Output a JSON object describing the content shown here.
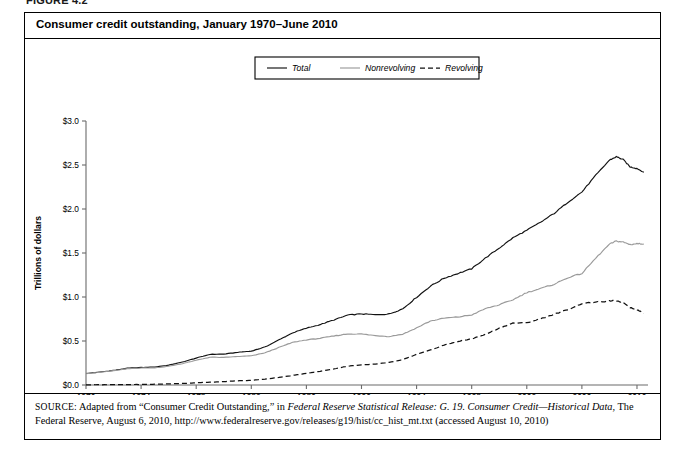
{
  "figure": {
    "label": "FIGURE 4.2",
    "title": "Consumer credit outstanding, January 1970–June 2010"
  },
  "source": {
    "prefix": "SOURCE:",
    "part1": " Adapted from “Consumer Credit Outstanding,” in ",
    "italic1": "Federal Reserve Statistical Release: G. 19. Consumer Credit—Historical Data",
    "part2": ", The Federal Reserve, August 6, 2010, http://www.federalreserve.gov/releases/g19/hist/cc_hist_mt.txt (accessed August 10, 2010)"
  },
  "chart_data": {
    "type": "line",
    "title": "Consumer credit outstanding, January 1970–June 2010",
    "xlabel": "Date",
    "ylabel": "Trillions of dollars",
    "xlim": [
      1970,
      2010.8
    ],
    "ylim": [
      0.0,
      3.0
    ],
    "grid": false,
    "legend_position": "top-center",
    "xticks": [
      1970,
      1974,
      1978,
      1982,
      1986,
      1990,
      1994,
      1998,
      2002,
      2006,
      2010
    ],
    "xtick_labels": [
      "1970",
      "1974",
      "1978",
      "1982",
      "1986",
      "1990",
      "1994",
      "1998",
      "2002",
      "2006",
      "2010"
    ],
    "yticks": [
      0.0,
      0.5,
      1.0,
      1.5,
      2.0,
      2.5,
      3.0
    ],
    "ytick_labels": [
      "$0.0",
      "$0.5",
      "$1.0",
      "$1.5",
      "$2.0",
      "$2.5",
      "$3.0"
    ],
    "x": [
      1970,
      1971,
      1972,
      1973,
      1974,
      1975,
      1976,
      1977,
      1978,
      1979,
      1980,
      1981,
      1982,
      1983,
      1984,
      1985,
      1986,
      1987,
      1988,
      1989,
      1990,
      1991,
      1992,
      1993,
      1994,
      1995,
      1996,
      1997,
      1998,
      1999,
      2000,
      2001,
      2002,
      2003,
      2004,
      2005,
      2006,
      2007,
      2008,
      2008.5,
      2009,
      2009.5,
      2010,
      2010.5
    ],
    "series": [
      {
        "name": "Total",
        "style": "solid",
        "color": "#111111",
        "values": [
          0.131,
          0.147,
          0.166,
          0.19,
          0.199,
          0.204,
          0.226,
          0.261,
          0.306,
          0.348,
          0.351,
          0.371,
          0.385,
          0.432,
          0.512,
          0.593,
          0.645,
          0.687,
          0.74,
          0.794,
          0.808,
          0.798,
          0.807,
          0.866,
          0.997,
          1.123,
          1.214,
          1.267,
          1.321,
          1.443,
          1.556,
          1.673,
          1.758,
          1.849,
          1.951,
          2.079,
          2.193,
          2.381,
          2.555,
          2.594,
          2.562,
          2.478,
          2.461,
          2.418
        ],
        "label_pos": "upper"
      },
      {
        "name": "Nonrevolving",
        "style": "solid",
        "color": "#9a9a9a",
        "values": [
          0.129,
          0.144,
          0.162,
          0.185,
          0.193,
          0.195,
          0.213,
          0.243,
          0.281,
          0.316,
          0.313,
          0.324,
          0.331,
          0.366,
          0.426,
          0.484,
          0.513,
          0.531,
          0.557,
          0.58,
          0.58,
          0.561,
          0.551,
          0.578,
          0.649,
          0.727,
          0.759,
          0.773,
          0.796,
          0.868,
          0.911,
          0.969,
          1.051,
          1.096,
          1.146,
          1.221,
          1.267,
          1.44,
          1.6,
          1.636,
          1.624,
          1.596,
          1.606,
          1.603
        ],
        "label_pos": "middle"
      },
      {
        "name": "Revolving",
        "style": "dashed",
        "color": "#111111",
        "values": [
          0.002,
          0.003,
          0.004,
          0.005,
          0.006,
          0.009,
          0.013,
          0.018,
          0.025,
          0.032,
          0.038,
          0.047,
          0.054,
          0.066,
          0.086,
          0.109,
          0.132,
          0.156,
          0.183,
          0.214,
          0.228,
          0.237,
          0.256,
          0.288,
          0.348,
          0.396,
          0.455,
          0.494,
          0.525,
          0.575,
          0.645,
          0.704,
          0.707,
          0.753,
          0.805,
          0.858,
          0.926,
          0.941,
          0.955,
          0.958,
          0.938,
          0.882,
          0.855,
          0.815
        ],
        "label_pos": "lower"
      }
    ]
  },
  "legend": {
    "items": [
      {
        "label": "Total",
        "style": "solid",
        "color": "#111111"
      },
      {
        "label": "Nonrevolving",
        "style": "solid",
        "color": "#9a9a9a"
      },
      {
        "label": "Revolving",
        "style": "dashed",
        "color": "#111111"
      }
    ]
  }
}
